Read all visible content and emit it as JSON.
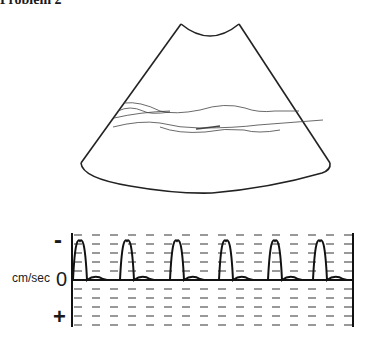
{
  "figure": {
    "title": "Problem 2",
    "fan": {
      "label": "ultrasound-sector-image",
      "top_left": [
        181,
        24
      ],
      "top_right": [
        239,
        24
      ],
      "bottom_left": [
        81,
        163
      ],
      "bottom_right": [
        330,
        163
      ]
    },
    "doppler": {
      "axis_label_unit": "cm/sec",
      "axis_label_zero": "0",
      "axis_label_negative": "-",
      "axis_label_positive": "+",
      "baseline_y": 280,
      "top_y": 233,
      "bottom_y": 327,
      "left_x": 72,
      "right_x": 353,
      "peak_x": [
        80,
        127,
        177,
        226,
        275,
        320
      ],
      "peak_y": 241,
      "row_y": [
        235,
        244,
        253,
        262,
        271,
        289,
        298,
        307,
        316,
        325
      ],
      "dash_start_x": 74,
      "dash_period": 18,
      "dash_length": 8
    }
  }
}
